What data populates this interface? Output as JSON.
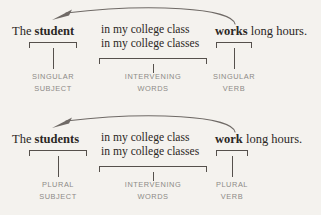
{
  "colors": {
    "background": "#f4f2ee",
    "text": "#2b2724",
    "rule": "#55504c",
    "caption": "#8d8a87",
    "arrow": "#6f6a66"
  },
  "blocks": [
    {
      "id": "singular-agreement-example",
      "arrow": {
        "name": "subject-verb-agreement-arrow",
        "direction": "verb-to-subject",
        "head": "left"
      },
      "segments": {
        "subject": {
          "plain_prefix": "The ",
          "emphasis": "student",
          "suffix": ""
        },
        "middle": {
          "line1": "in my college class",
          "line2": "in my college classes"
        },
        "verb": {
          "emphasis": "works",
          "suffix": " long hours."
        }
      },
      "captions": [
        {
          "line1": "SINGULAR",
          "line2": "SUBJECT"
        },
        {
          "line1": "INTERVENING",
          "line2": "WORDS"
        },
        {
          "line1": "SINGULAR",
          "line2": "VERB"
        }
      ]
    },
    {
      "id": "plural-agreement-example",
      "arrow": {
        "name": "subject-verb-agreement-arrow",
        "direction": "verb-to-subject",
        "head": "left"
      },
      "segments": {
        "subject": {
          "plain_prefix": "The ",
          "emphasis": "students",
          "suffix": ""
        },
        "middle": {
          "line1": "in my college class",
          "line2": "in my college classes"
        },
        "verb": {
          "emphasis": "work",
          "suffix": " long hours."
        }
      },
      "captions": [
        {
          "line1": "PLURAL",
          "line2": "SUBJECT"
        },
        {
          "line1": "INTERVENING",
          "line2": "WORDS"
        },
        {
          "line1": "PLURAL",
          "line2": "VERB"
        }
      ]
    }
  ]
}
